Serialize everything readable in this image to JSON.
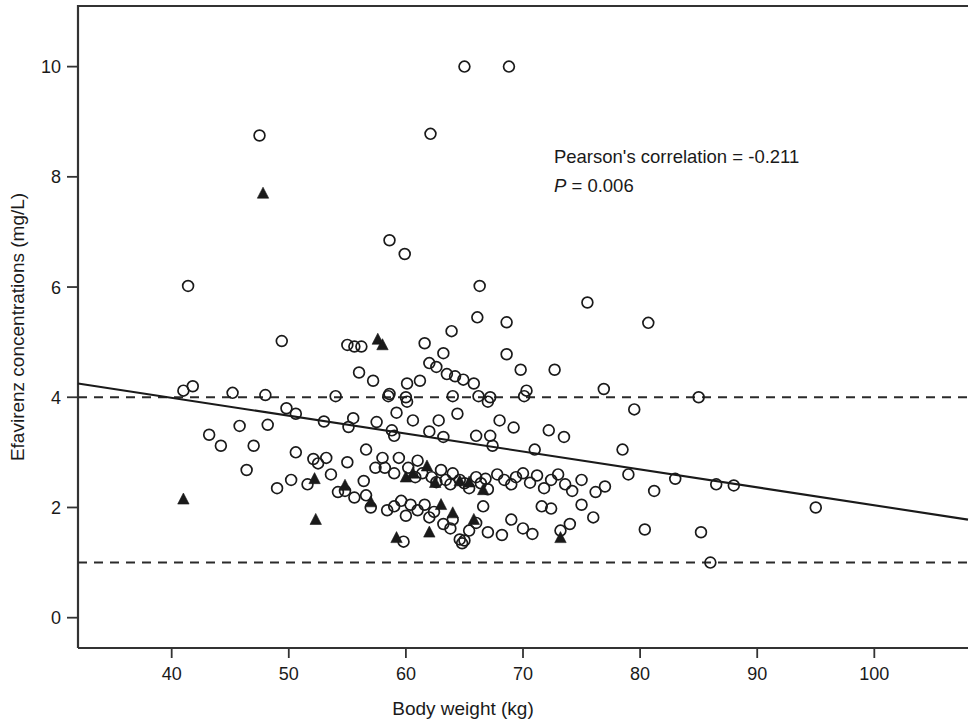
{
  "chart_data": {
    "type": "scatter",
    "title": "",
    "xlabel": "Body weight (kg)",
    "ylabel": "Efavirenz concentrations (mg/L)",
    "xlim": [
      32,
      108
    ],
    "ylim": [
      -0.55,
      11.1
    ],
    "xticks": [
      40,
      50,
      60,
      70,
      80,
      90,
      100
    ],
    "yticks": [
      0,
      2,
      4,
      6,
      8,
      10
    ],
    "xtick_labels": [
      "40",
      "50",
      "60",
      "70",
      "80",
      "90",
      "100"
    ],
    "ytick_labels": [
      "0",
      "2",
      "4",
      "6",
      "8",
      "10"
    ],
    "grid": false,
    "legend": "none",
    "marker_color": "#1a1a1a",
    "line_color": "#1a1a1a",
    "annotations": [
      {
        "text": "Pearson's correlation = -0.211",
        "x": 80.5,
        "y": 8.25,
        "italic": false
      },
      {
        "text": "P = 0.006",
        "x": 80.5,
        "y": 7.72,
        "italic_prefix": "P"
      }
    ],
    "reference_lines": [
      {
        "y": 4.0,
        "style": "dashed",
        "label": "upper therapeutic threshold"
      },
      {
        "y": 1.0,
        "style": "dashed",
        "label": "lower therapeutic threshold"
      }
    ],
    "regression_line": {
      "style": "solid",
      "x_start": 32.0,
      "y_start": 4.25,
      "x_end": 108.0,
      "y_end": 1.78
    },
    "series": [
      {
        "name": "open-circle",
        "marker": "circle-open",
        "points": [
          [
            65.0,
            10.0
          ],
          [
            68.8,
            10.0
          ],
          [
            62.1,
            8.78
          ],
          [
            47.5,
            8.75
          ],
          [
            58.6,
            6.85
          ],
          [
            59.9,
            6.6
          ],
          [
            41.4,
            6.02
          ],
          [
            66.3,
            6.02
          ],
          [
            75.5,
            5.72
          ],
          [
            68.6,
            5.36
          ],
          [
            80.7,
            5.35
          ],
          [
            66.1,
            5.45
          ],
          [
            63.9,
            5.2
          ],
          [
            55.0,
            4.95
          ],
          [
            55.6,
            4.92
          ],
          [
            56.2,
            4.92
          ],
          [
            49.4,
            5.02
          ],
          [
            61.6,
            4.98
          ],
          [
            63.2,
            4.8
          ],
          [
            68.6,
            4.78
          ],
          [
            62.0,
            4.62
          ],
          [
            62.6,
            4.55
          ],
          [
            63.5,
            4.42
          ],
          [
            64.2,
            4.38
          ],
          [
            64.9,
            4.32
          ],
          [
            61.2,
            4.3
          ],
          [
            65.8,
            4.25
          ],
          [
            69.8,
            4.5
          ],
          [
            72.7,
            4.5
          ],
          [
            60.1,
            4.25
          ],
          [
            45.2,
            4.08
          ],
          [
            41.0,
            4.12
          ],
          [
            41.8,
            4.2
          ],
          [
            48.0,
            4.04
          ],
          [
            54.0,
            4.02
          ],
          [
            58.5,
            4.02
          ],
          [
            58.6,
            4.06
          ],
          [
            60.0,
            4.0
          ],
          [
            60.1,
            3.92
          ],
          [
            64.0,
            4.02
          ],
          [
            66.2,
            4.02
          ],
          [
            67.2,
            4.0
          ],
          [
            70.1,
            4.02
          ],
          [
            70.3,
            4.12
          ],
          [
            76.9,
            4.15
          ],
          [
            79.5,
            3.78
          ],
          [
            85.0,
            4.0
          ],
          [
            67.0,
            3.92
          ],
          [
            49.8,
            3.8
          ],
          [
            50.6,
            3.7
          ],
          [
            53.0,
            3.56
          ],
          [
            55.5,
            3.62
          ],
          [
            55.1,
            3.46
          ],
          [
            57.5,
            3.55
          ],
          [
            58.8,
            3.4
          ],
          [
            62.0,
            3.38
          ],
          [
            59.0,
            3.3
          ],
          [
            63.2,
            3.28
          ],
          [
            66.0,
            3.3
          ],
          [
            67.2,
            3.3
          ],
          [
            67.4,
            3.12
          ],
          [
            71.0,
            3.05
          ],
          [
            72.2,
            3.4
          ],
          [
            73.5,
            3.28
          ],
          [
            78.5,
            3.05
          ],
          [
            43.2,
            3.32
          ],
          [
            44.2,
            3.12
          ],
          [
            47.0,
            3.12
          ],
          [
            46.4,
            2.68
          ],
          [
            50.6,
            3.0
          ],
          [
            52.1,
            2.88
          ],
          [
            52.5,
            2.8
          ],
          [
            53.2,
            2.9
          ],
          [
            55.0,
            2.82
          ],
          [
            56.6,
            3.05
          ],
          [
            57.4,
            2.72
          ],
          [
            58.0,
            2.9
          ],
          [
            58.2,
            2.72
          ],
          [
            59.0,
            2.62
          ],
          [
            59.4,
            2.9
          ],
          [
            60.2,
            2.72
          ],
          [
            60.8,
            2.55
          ],
          [
            61.0,
            2.85
          ],
          [
            61.4,
            2.62
          ],
          [
            62.2,
            2.55
          ],
          [
            62.6,
            2.46
          ],
          [
            63.0,
            2.68
          ],
          [
            63.4,
            2.5
          ],
          [
            63.8,
            2.42
          ],
          [
            64.0,
            2.62
          ],
          [
            64.6,
            2.5
          ],
          [
            65.0,
            2.44
          ],
          [
            65.4,
            2.35
          ],
          [
            66.0,
            2.55
          ],
          [
            66.4,
            2.44
          ],
          [
            66.8,
            2.52
          ],
          [
            67.0,
            2.33
          ],
          [
            67.8,
            2.6
          ],
          [
            68.4,
            2.5
          ],
          [
            69.0,
            2.42
          ],
          [
            69.4,
            2.55
          ],
          [
            70.0,
            2.62
          ],
          [
            70.6,
            2.45
          ],
          [
            71.2,
            2.58
          ],
          [
            71.8,
            2.35
          ],
          [
            72.4,
            2.5
          ],
          [
            73.0,
            2.6
          ],
          [
            73.6,
            2.42
          ],
          [
            74.2,
            2.3
          ],
          [
            75.0,
            2.5
          ],
          [
            76.2,
            2.28
          ],
          [
            77.0,
            2.38
          ],
          [
            79.0,
            2.6
          ],
          [
            81.2,
            2.3
          ],
          [
            83.0,
            2.52
          ],
          [
            86.5,
            2.42
          ],
          [
            88.0,
            2.4
          ],
          [
            95.0,
            2.0
          ],
          [
            49.0,
            2.35
          ],
          [
            54.2,
            2.28
          ],
          [
            54.8,
            2.3
          ],
          [
            55.6,
            2.18
          ],
          [
            56.6,
            2.22
          ],
          [
            57.0,
            2.0
          ],
          [
            58.4,
            1.95
          ],
          [
            59.0,
            2.02
          ],
          [
            59.6,
            2.12
          ],
          [
            60.0,
            1.85
          ],
          [
            60.4,
            2.05
          ],
          [
            61.0,
            1.95
          ],
          [
            61.6,
            2.05
          ],
          [
            62.0,
            1.82
          ],
          [
            62.4,
            1.92
          ],
          [
            63.2,
            1.7
          ],
          [
            63.8,
            1.62
          ],
          [
            64.0,
            1.78
          ],
          [
            64.6,
            1.42
          ],
          [
            65.0,
            1.4
          ],
          [
            65.4,
            1.58
          ],
          [
            66.0,
            1.72
          ],
          [
            67.0,
            1.55
          ],
          [
            68.2,
            1.5
          ],
          [
            69.0,
            1.78
          ],
          [
            70.0,
            1.62
          ],
          [
            70.8,
            1.52
          ],
          [
            71.6,
            2.02
          ],
          [
            72.4,
            1.98
          ],
          [
            73.2,
            1.58
          ],
          [
            74.0,
            1.7
          ],
          [
            75.0,
            2.05
          ],
          [
            76.0,
            1.82
          ],
          [
            80.4,
            1.6
          ],
          [
            85.2,
            1.55
          ],
          [
            86.0,
            1.0
          ],
          [
            45.8,
            3.48
          ],
          [
            48.2,
            3.5
          ],
          [
            56.0,
            4.45
          ],
          [
            57.2,
            4.3
          ],
          [
            59.2,
            3.72
          ],
          [
            60.6,
            3.58
          ],
          [
            62.8,
            3.58
          ],
          [
            64.4,
            3.7
          ],
          [
            68.0,
            3.58
          ],
          [
            69.2,
            3.45
          ],
          [
            59.8,
            1.38
          ],
          [
            64.8,
            1.35
          ],
          [
            66.6,
            2.02
          ],
          [
            56.4,
            2.48
          ],
          [
            53.6,
            2.6
          ],
          [
            51.6,
            2.42
          ],
          [
            50.2,
            2.5
          ]
        ]
      },
      {
        "name": "filled-triangle",
        "marker": "triangle-filled",
        "points": [
          [
            47.8,
            7.7
          ],
          [
            57.6,
            5.05
          ],
          [
            58.0,
            4.95
          ],
          [
            52.2,
            2.52
          ],
          [
            52.3,
            1.78
          ],
          [
            54.8,
            2.4
          ],
          [
            57.0,
            2.1
          ],
          [
            59.2,
            1.45
          ],
          [
            60.6,
            2.62
          ],
          [
            61.8,
            2.75
          ],
          [
            62.5,
            2.45
          ],
          [
            63.0,
            2.05
          ],
          [
            64.0,
            1.9
          ],
          [
            64.6,
            2.48
          ],
          [
            65.4,
            2.46
          ],
          [
            65.8,
            1.78
          ],
          [
            66.6,
            2.32
          ],
          [
            41.0,
            2.15
          ],
          [
            73.2,
            1.45
          ],
          [
            62.0,
            1.55
          ],
          [
            60.0,
            2.55
          ]
        ]
      }
    ]
  }
}
